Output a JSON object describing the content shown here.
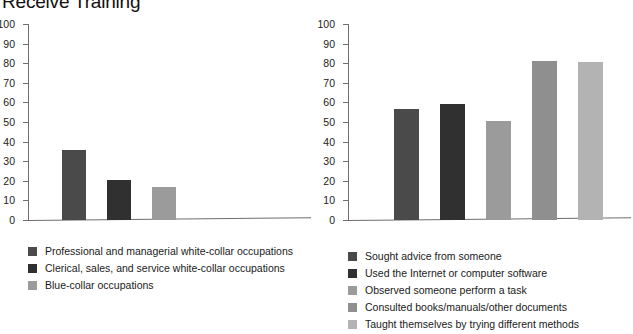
{
  "page": {
    "title": "Receive Training"
  },
  "colors": {
    "axis": "#6f6f6f",
    "text": "#1a1a1a",
    "series": [
      "#4a4a4a",
      "#303030",
      "#9b9b9b",
      "#8f8f8f",
      "#b3b3b3"
    ]
  },
  "chart_data": [
    {
      "type": "bar",
      "title": "Receive Training",
      "xlabel": "",
      "ylabel": "",
      "ylim": [
        0,
        100
      ],
      "yticks": [
        0,
        10,
        20,
        30,
        40,
        50,
        60,
        70,
        80,
        90,
        100
      ],
      "ticklabels": [
        "0",
        "10",
        "20",
        "30",
        "40",
        "50",
        "60",
        "70",
        "80",
        "90",
        "100"
      ],
      "grid": false,
      "legend_position": "below",
      "categories": [
        "Professional and managerial white-collar occupations",
        "Clerical, sales, and service white-collar occupations",
        "Blue-collar occupations"
      ],
      "values": [
        35.5,
        20.5,
        17
      ],
      "colors": [
        "#4a4a4a",
        "#303030",
        "#9b9b9b"
      ]
    },
    {
      "type": "bar",
      "title": "",
      "xlabel": "",
      "ylabel": "",
      "ylim": [
        0,
        100
      ],
      "yticks": [
        0,
        10,
        20,
        30,
        40,
        50,
        60,
        70,
        80,
        90,
        100
      ],
      "ticklabels": [
        "0",
        "10",
        "20",
        "30",
        "40",
        "50",
        "60",
        "70",
        "80",
        "90",
        "100"
      ],
      "grid": false,
      "legend_position": "below",
      "categories": [
        "Sought advice from someone",
        "Used the Internet or computer software",
        "Observed someone perform a task",
        "Consulted books/manuals/other documents",
        "Taught themselves by trying different methods"
      ],
      "values": [
        56.5,
        59,
        50.5,
        81,
        80.5
      ],
      "colors": [
        "#4a4a4a",
        "#303030",
        "#9b9b9b",
        "#8f8f8f",
        "#b3b3b3"
      ]
    }
  ]
}
